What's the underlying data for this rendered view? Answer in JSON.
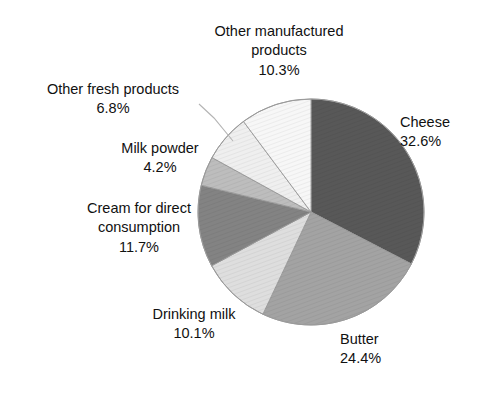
{
  "chart_data": {
    "type": "pie",
    "title": "",
    "subtitle": "",
    "xlabel": "",
    "ylabel": "",
    "legend_position": "none",
    "grid": false,
    "units": "percent",
    "start_angle_deg": 0,
    "direction": "clockwise",
    "categories": [
      "Cheese",
      "Butter",
      "Drinking milk",
      "Cream for direct consumption",
      "Milk powder",
      "Other fresh products",
      "Other manufactured products"
    ],
    "values": [
      32.6,
      24.4,
      10.1,
      11.7,
      4.2,
      6.8,
      10.3
    ],
    "slices": [
      {
        "name": "Cheese",
        "label_line1": "Cheese",
        "value": 32.6,
        "value_label": "32.6%",
        "color": "#585858",
        "start_deg": 0.0,
        "end_deg": 117.36
      },
      {
        "name": "Butter",
        "label_line1": "Butter",
        "value": 24.4,
        "value_label": "24.4%",
        "color": "#a3a3a3",
        "start_deg": 117.36,
        "end_deg": 205.2
      },
      {
        "name": "Drinking milk",
        "label_line1": "Drinking milk",
        "value": 10.1,
        "value_label": "10.1%",
        "color": "#dedede",
        "start_deg": 205.2,
        "end_deg": 241.56
      },
      {
        "name": "Cream for direct consumption",
        "label_line1": "Cream for direct",
        "label_line2": "consumption",
        "value": 11.7,
        "value_label": "11.7%",
        "color": "#838383",
        "start_deg": 241.56,
        "end_deg": 283.68
      },
      {
        "name": "Milk powder",
        "label_line1": "Milk powder",
        "value": 4.2,
        "value_label": "4.2%",
        "color": "#bdbdbd",
        "start_deg": 283.68,
        "end_deg": 298.8
      },
      {
        "name": "Other fresh products",
        "label_line1": "Other fresh products",
        "value": 6.8,
        "value_label": "6.8%",
        "color": "#efefef",
        "start_deg": 298.8,
        "end_deg": 323.28
      },
      {
        "name": "Other manufactured products",
        "label_line1": "Other manufactured",
        "label_line2": "products",
        "value": 10.3,
        "value_label": "10.3%",
        "color": "#f7f7f7",
        "start_deg": 323.28,
        "end_deg": 360.0
      }
    ],
    "geometry": {
      "center_x": 311,
      "center_y": 212,
      "radius": 113
    },
    "colors": {
      "outline": "#9a9a9a",
      "background": "#ffffff",
      "text": "#111111",
      "leader_line": "#b4b4b4"
    }
  },
  "labels": {
    "cheese": {
      "name": "Cheese",
      "value": "32.6%"
    },
    "butter": {
      "name": "Butter",
      "value": "24.4%"
    },
    "drinking_milk": {
      "name": "Drinking milk",
      "value": "10.1%"
    },
    "cream": {
      "name_line1": "Cream for direct",
      "name_line2": "consumption",
      "value": "11.7%"
    },
    "milk_powder": {
      "name": "Milk powder",
      "value": "4.2%"
    },
    "other_fresh": {
      "name": "Other fresh products",
      "value": "6.8%"
    },
    "other_manufactured": {
      "name_line1": "Other manufactured",
      "name_line2": "products",
      "value": "10.3%"
    }
  }
}
